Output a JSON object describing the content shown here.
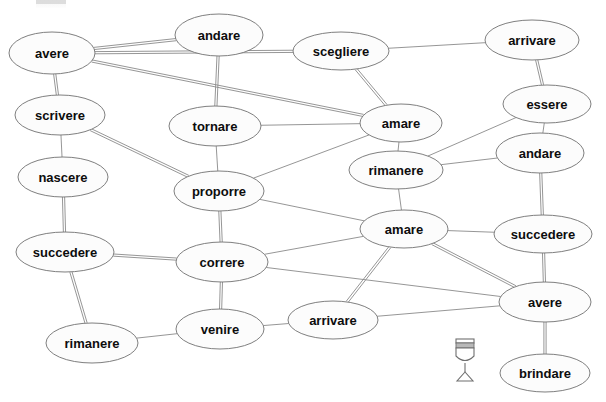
{
  "diagram": {
    "width": 606,
    "height": 402,
    "background_color": "#ffffff",
    "node_fill_color": "#fcfcfc",
    "node_stroke_color": "#707070",
    "edge_color": "#8a8a8a",
    "label_color": "#0d0d0d",
    "nodes": [
      {
        "id": "avere_tl",
        "label": "avere",
        "cx": 52,
        "cy": 53,
        "rx": 43,
        "ry": 21,
        "font": 13
      },
      {
        "id": "andare_top",
        "label": "andare",
        "cx": 219,
        "cy": 35,
        "rx": 44,
        "ry": 21,
        "font": 13
      },
      {
        "id": "scegliere",
        "label": "scegliere",
        "cx": 341,
        "cy": 51,
        "rx": 48,
        "ry": 19,
        "font": 13
      },
      {
        "id": "arrivare_tr",
        "label": "arrivare",
        "cx": 532,
        "cy": 40,
        "rx": 47,
        "ry": 20,
        "font": 13
      },
      {
        "id": "scrivere",
        "label": "scrivere",
        "cx": 60,
        "cy": 115,
        "rx": 45,
        "ry": 20,
        "font": 13
      },
      {
        "id": "tornare",
        "label": "tornare",
        "cx": 215,
        "cy": 126,
        "rx": 46,
        "ry": 20,
        "font": 13
      },
      {
        "id": "amare_up",
        "label": "amare",
        "cx": 401,
        "cy": 123,
        "rx": 41,
        "ry": 19,
        "font": 13
      },
      {
        "id": "essere",
        "label": "essere",
        "cx": 547,
        "cy": 104,
        "rx": 44,
        "ry": 19,
        "font": 13
      },
      {
        "id": "nascere",
        "label": "nascere",
        "cx": 63,
        "cy": 177,
        "rx": 45,
        "ry": 20,
        "font": 13
      },
      {
        "id": "rimanere_mid",
        "label": "rimanere",
        "cx": 396,
        "cy": 170,
        "rx": 47,
        "ry": 19,
        "font": 13
      },
      {
        "id": "andare_right",
        "label": "andare",
        "cx": 540,
        "cy": 153,
        "rx": 44,
        "ry": 20,
        "font": 13
      },
      {
        "id": "proporre",
        "label": "proporre",
        "cx": 219,
        "cy": 191,
        "rx": 45,
        "ry": 20,
        "font": 13
      },
      {
        "id": "amare_low",
        "label": "amare",
        "cx": 404,
        "cy": 229,
        "rx": 44,
        "ry": 19,
        "font": 13
      },
      {
        "id": "succedere_r",
        "label": "succedere",
        "cx": 543,
        "cy": 234,
        "rx": 49,
        "ry": 19,
        "font": 13
      },
      {
        "id": "succedere_l",
        "label": "succedere",
        "cx": 65,
        "cy": 252,
        "rx": 49,
        "ry": 20,
        "font": 13
      },
      {
        "id": "correre",
        "label": "correre",
        "cx": 222,
        "cy": 262,
        "rx": 46,
        "ry": 20,
        "font": 13
      },
      {
        "id": "avere_r",
        "label": "avere",
        "cx": 545,
        "cy": 302,
        "rx": 46,
        "ry": 20,
        "font": 13
      },
      {
        "id": "arrivare_bot",
        "label": "arrivare",
        "cx": 333,
        "cy": 320,
        "rx": 45,
        "ry": 19,
        "font": 13
      },
      {
        "id": "venire",
        "label": "venire",
        "cx": 220,
        "cy": 329,
        "rx": 44,
        "ry": 20,
        "font": 13
      },
      {
        "id": "rimanere_bl",
        "label": "rimanere",
        "cx": 92,
        "cy": 343,
        "rx": 46,
        "ry": 20,
        "font": 13
      },
      {
        "id": "brindare",
        "label": "brindare",
        "cx": 545,
        "cy": 373,
        "rx": 45,
        "ry": 19,
        "font": 13
      }
    ],
    "edges": [
      {
        "from": "avere_tl",
        "to": "andare_top",
        "offset": 2.2
      },
      {
        "from": "avere_tl",
        "to": "scegliere",
        "offset": 2.2
      },
      {
        "from": "avere_tl",
        "to": "amare_up",
        "offset": 2.2
      },
      {
        "from": "avere_tl",
        "to": "scrivere",
        "offset": 2.2
      },
      {
        "from": "andare_top",
        "to": "tornare",
        "offset": 2.2
      },
      {
        "from": "scegliere",
        "to": "amare_up",
        "offset": 2.2
      },
      {
        "from": "scegliere",
        "to": "arrivare_tr",
        "offset": 0
      },
      {
        "from": "arrivare_tr",
        "to": "essere",
        "offset": 2.2
      },
      {
        "from": "scrivere",
        "to": "nascere",
        "offset": 0
      },
      {
        "from": "scrivere",
        "to": "proporre",
        "offset": 2.2
      },
      {
        "from": "tornare",
        "to": "proporre",
        "offset": 0
      },
      {
        "from": "tornare",
        "to": "amare_up",
        "offset": 0
      },
      {
        "from": "amare_up",
        "to": "rimanere_mid",
        "offset": 0
      },
      {
        "from": "amare_up",
        "to": "proporre",
        "offset": 0
      },
      {
        "from": "essere",
        "to": "rimanere_mid",
        "offset": 0
      },
      {
        "from": "essere",
        "to": "andare_right",
        "offset": 0
      },
      {
        "from": "nascere",
        "to": "succedere_l",
        "offset": 2.2
      },
      {
        "from": "rimanere_mid",
        "to": "andare_right",
        "offset": 0
      },
      {
        "from": "rimanere_mid",
        "to": "amare_low",
        "offset": 0
      },
      {
        "from": "andare_right",
        "to": "succedere_r",
        "offset": 2.2
      },
      {
        "from": "proporre",
        "to": "amare_low",
        "offset": 0
      },
      {
        "from": "proporre",
        "to": "correre",
        "offset": 2.2
      },
      {
        "from": "amare_low",
        "to": "succedere_r",
        "offset": 0
      },
      {
        "from": "amare_low",
        "to": "avere_r",
        "offset": 2.2
      },
      {
        "from": "amare_low",
        "to": "arrivare_bot",
        "offset": 2.2
      },
      {
        "from": "amare_low",
        "to": "correre",
        "offset": 0
      },
      {
        "from": "succedere_r",
        "to": "avere_r",
        "offset": 2.2
      },
      {
        "from": "succedere_l",
        "to": "correre",
        "offset": 2.2
      },
      {
        "from": "succedere_l",
        "to": "rimanere_bl",
        "offset": 2.2
      },
      {
        "from": "correre",
        "to": "venire",
        "offset": 2.2
      },
      {
        "from": "correre",
        "to": "avere_r",
        "offset": 0
      },
      {
        "from": "avere_r",
        "to": "brindare",
        "offset": 2.2
      },
      {
        "from": "avere_r",
        "to": "arrivare_bot",
        "offset": 0
      },
      {
        "from": "arrivare_bot",
        "to": "venire",
        "offset": 0
      },
      {
        "from": "venire",
        "to": "rimanere_bl",
        "offset": 0
      }
    ],
    "icons": [
      {
        "id": "champagne-glass",
        "name": "champagne-glass-icon",
        "x": 456,
        "y": 339,
        "width": 18,
        "height": 42,
        "stroke_color": "#6f6f6f",
        "band_color": "#b8b8b8"
      }
    ]
  }
}
